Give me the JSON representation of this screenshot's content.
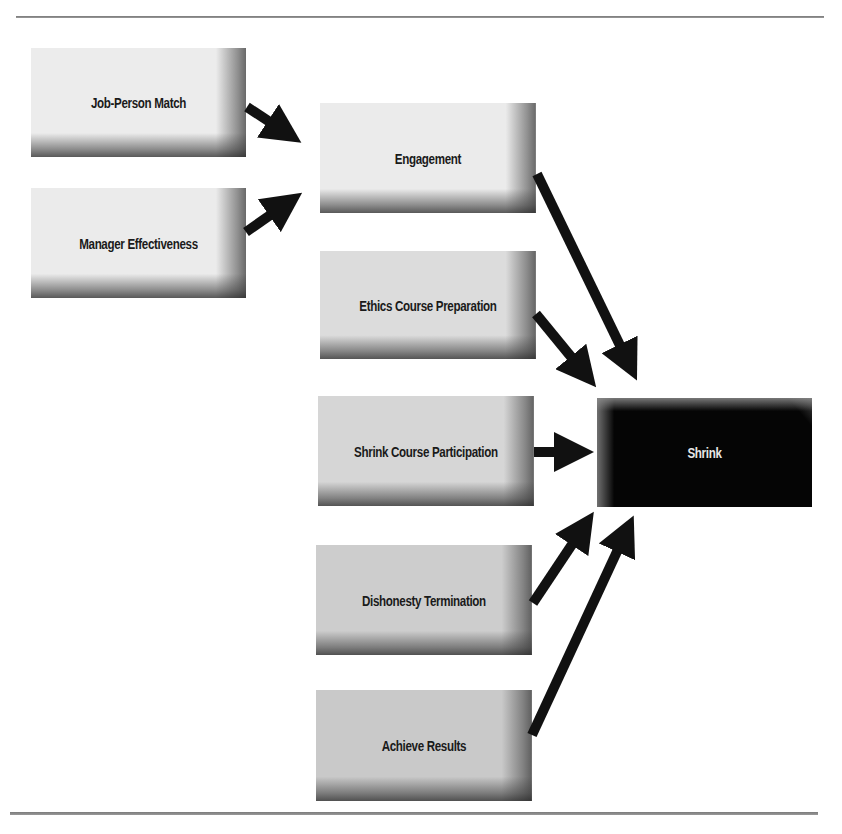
{
  "diagram": {
    "type": "flow",
    "nodes": [
      {
        "id": "job_person_match",
        "label": "Job-Person Match",
        "column": 1,
        "style": "light-gray"
      },
      {
        "id": "manager_effectiveness",
        "label": "Manager Effectiveness",
        "column": 1,
        "style": "light-gray"
      },
      {
        "id": "engagement",
        "label": "Engagement",
        "column": 2,
        "style": "light-gray"
      },
      {
        "id": "ethics_course_preparation",
        "label": "Ethics Course Preparation",
        "column": 2,
        "style": "gray"
      },
      {
        "id": "shrink_course_participation",
        "label": "Shrink Course Participation",
        "column": 2,
        "style": "gray"
      },
      {
        "id": "dishonesty_termination",
        "label": "Dishonesty Termination",
        "column": 2,
        "style": "medium-gray"
      },
      {
        "id": "achieve_results",
        "label": "Achieve Results",
        "column": 2,
        "style": "medium-gray"
      },
      {
        "id": "shrink",
        "label": "Shrink",
        "column": 3,
        "style": "black"
      }
    ],
    "edges": [
      {
        "from": "job_person_match",
        "to": "engagement"
      },
      {
        "from": "manager_effectiveness",
        "to": "engagement"
      },
      {
        "from": "engagement",
        "to": "shrink"
      },
      {
        "from": "ethics_course_preparation",
        "to": "shrink"
      },
      {
        "from": "shrink_course_participation",
        "to": "shrink"
      },
      {
        "from": "dishonesty_termination",
        "to": "shrink"
      },
      {
        "from": "achieve_results",
        "to": "shrink"
      }
    ],
    "colors": {
      "arrow": "#111111",
      "outcome_box": "#050505",
      "outcome_text": "#e8e8e8",
      "box_text": "#1a1a1a"
    }
  }
}
